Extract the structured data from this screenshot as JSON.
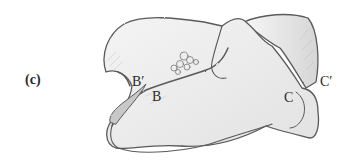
{
  "figure": {
    "panel_label": "(c)",
    "labels": {
      "b_prime": "B′",
      "b": "B",
      "c": "C",
      "c_prime": "C′"
    },
    "style": {
      "outline_color": "#5a5a5a",
      "shade_color": "#d8d8d8",
      "background": "#ffffff"
    }
  }
}
